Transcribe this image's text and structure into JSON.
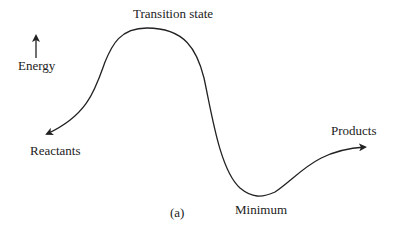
{
  "diagram": {
    "type": "energy-profile",
    "axis_label": "Energy",
    "labels": {
      "transition_state": "Transition state",
      "reactants": "Reactants",
      "products": "Products",
      "minimum": "Minimum",
      "caption": "(a)"
    },
    "stroke_color": "#222222",
    "curve_points": [
      [
        45,
        135
      ],
      [
        75,
        118
      ],
      [
        108,
        60
      ],
      [
        147,
        28
      ],
      [
        190,
        40
      ],
      [
        204,
        80
      ],
      [
        215,
        118
      ],
      [
        255,
        195
      ],
      [
        300,
        175
      ],
      [
        365,
        147
      ]
    ]
  }
}
